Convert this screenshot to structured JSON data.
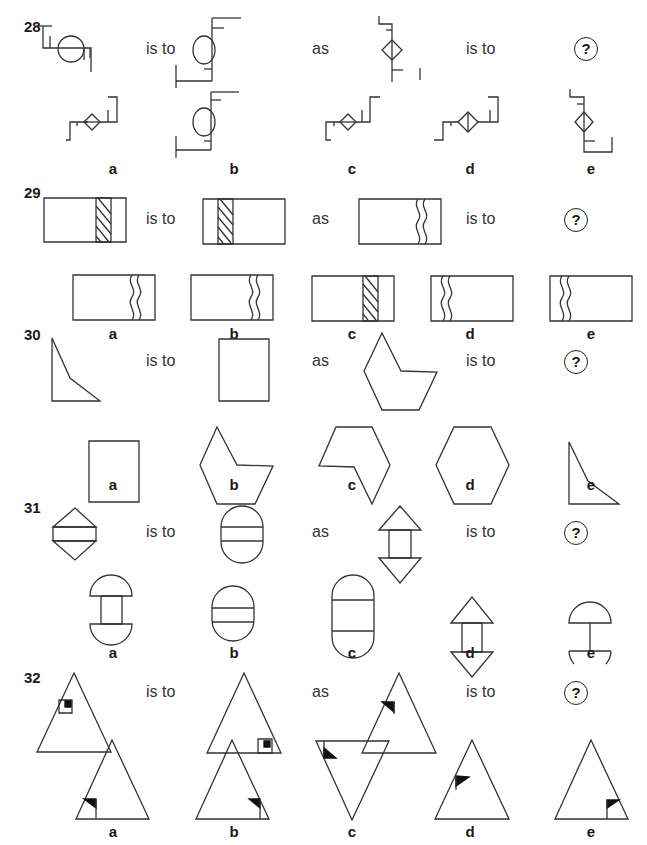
{
  "questions": [
    {
      "number": "28",
      "is_to_1": "is to",
      "as": "as",
      "is_to_2": "is to",
      "unknown": "?",
      "options": [
        "a",
        "b",
        "c",
        "d",
        "e"
      ]
    },
    {
      "number": "29",
      "is_to_1": "is to",
      "as": "as",
      "is_to_2": "is to",
      "unknown": "?",
      "options": [
        "a",
        "b",
        "c",
        "d",
        "e"
      ]
    },
    {
      "number": "30",
      "is_to_1": "is to",
      "as": "as",
      "is_to_2": "is to",
      "unknown": "?",
      "options": [
        "a",
        "b",
        "c",
        "d",
        "e"
      ]
    },
    {
      "number": "31",
      "is_to_1": "is to",
      "as": "as",
      "is_to_2": "is to",
      "unknown": "?",
      "options": [
        "a",
        "b",
        "c",
        "d",
        "e"
      ]
    },
    {
      "number": "32",
      "is_to_1": "is to",
      "as": "as",
      "is_to_2": "is to",
      "unknown": "?",
      "options": [
        "a",
        "b",
        "c",
        "d",
        "e"
      ]
    }
  ],
  "figures": {
    "q28": {
      "stem": [
        "pipe-circle-horizontal",
        "pipe-circle-vertical",
        "pipe-diamond-vertical"
      ],
      "options": [
        "pipe-diamond-horizontal",
        "pipe-circle-vertical",
        "pipe-diamond-horizontal",
        "pipe-diamond-split-horizontal",
        "pipe-diamond-vertical"
      ]
    },
    "q29": {
      "stem": [
        "rect-hatched-band-right",
        "rect-hatched-band-left",
        "rect-wavy-band-right"
      ],
      "options": [
        "rect-wavy-band-right",
        "rect-wavy-band-right",
        "rect-hatched-band-right",
        "rect-wavy-band-left",
        "rect-wavy-band-left"
      ]
    },
    "q30": {
      "stem": [
        "quadrilateral-kite",
        "rectangle",
        "concave-hexagon"
      ],
      "options": [
        "rectangle",
        "concave-hexagon",
        "concave-hexagon-rotated",
        "hexagon",
        "quadrilateral-kite"
      ]
    },
    "q31": {
      "stem": [
        "diamond-split-band",
        "capsule-split-band",
        "arrows-connected"
      ],
      "options": [
        "semicircles-connected",
        "capsule-band",
        "capsule-tall-band",
        "arrows-connected",
        "semicircles-single-stem"
      ]
    },
    "q32": {
      "stem": [
        "triangle-square-left",
        "triangle-square-bottom-right",
        "triangle-flag-left"
      ],
      "options": [
        "triangle-flag-bottom-left",
        "triangle-flag-bottom-right",
        "inverted-triangle-flag-top-left",
        "triangle-flag-left-mid",
        "triangle-flag-bottom-right-alt"
      ]
    }
  }
}
